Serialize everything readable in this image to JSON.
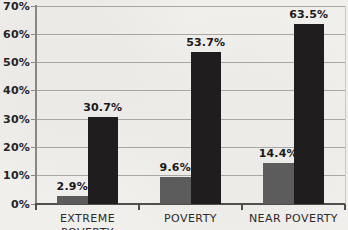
{
  "chart_data": {
    "type": "bar",
    "title": "",
    "categories": [
      "EXTREME POVERTY",
      "POVERTY",
      "NEAR POVERTY"
    ],
    "series": [
      {
        "name": "gray-series",
        "color": "#5d5c5c",
        "values": [
          2.9,
          9.6,
          14.4
        ],
        "data_labels": [
          "2.9%",
          "9.6%",
          "14.4%"
        ]
      },
      {
        "name": "black-series",
        "color": "#201d1e",
        "values": [
          30.7,
          53.7,
          63.5
        ],
        "data_labels": [
          "30.7%",
          "53.7%",
          "63.5%"
        ]
      }
    ],
    "xlabel": "",
    "ylabel": "",
    "y_axis": {
      "min": 0,
      "max": 70,
      "tick_values": [
        0,
        10,
        20,
        30,
        40,
        50,
        60,
        70
      ],
      "tick_labels": [
        "0%",
        "10%",
        "20%",
        "30%",
        "40%",
        "50%",
        "60%",
        "70%"
      ]
    },
    "grid": true,
    "legend": "none"
  },
  "colors": {
    "background": "#f1efec",
    "gridline": "#a9a7a3",
    "y_axis_line": "#8b8884",
    "x_axis_line": "#514e4b",
    "tick_label_text": "#262324",
    "data_label_text": "#1b1819",
    "category_label_text": "#2d2a2b"
  }
}
